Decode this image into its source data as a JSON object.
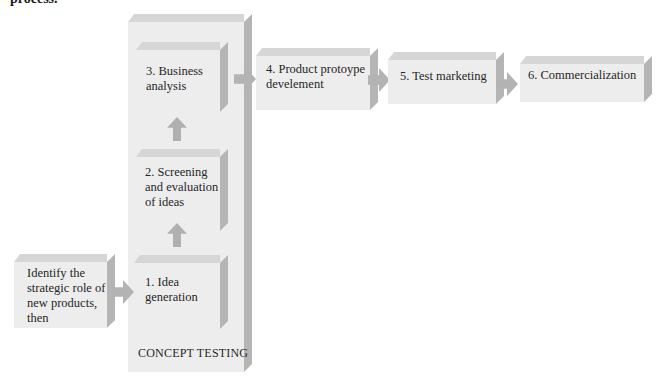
{
  "caption": "process.",
  "container": {
    "label": "CONCEPT TESTING"
  },
  "start": {
    "label": "Identify the\nstrategic role of\nnew products,\nthen"
  },
  "steps": [
    {
      "label": "1.  Idea\ngeneration"
    },
    {
      "label": "2.  Screening\nand evaluation\nof ideas"
    },
    {
      "label": "3.  Business\nanalysis"
    },
    {
      "label": "4.  Product protoype\ndevelement"
    },
    {
      "label": "5.  Test marketing"
    },
    {
      "label": "6.  Commercialization"
    }
  ],
  "colors": {
    "box_face": "#ededed",
    "box_top": "#d6d6d6",
    "box_side": "#b5b5b5",
    "arrow": "#b3b3b3"
  }
}
